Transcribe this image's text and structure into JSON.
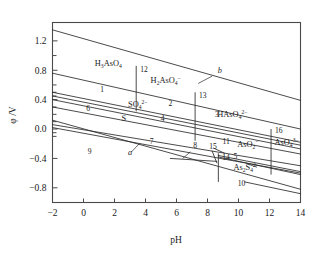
{
  "chart_data": {
    "type": "line",
    "title": "",
    "xlabel": "pH",
    "ylabel": "φ /V",
    "xlim": [
      -2,
      14
    ],
    "ylim": [
      -1.0,
      1.45
    ],
    "xticks": [
      -2,
      0,
      2,
      4,
      6,
      8,
      10,
      12,
      14
    ],
    "xticklabels": [
      "−2",
      "0",
      "2",
      "4",
      "6",
      "8",
      "10",
      "12",
      "14"
    ],
    "yticks": [
      1.2,
      0.8,
      0.4,
      0.0,
      -0.4,
      -0.8
    ],
    "yticklabels": [
      "1.2",
      "0.8",
      "0.4",
      "0.0",
      "−0.4",
      "−0.8"
    ],
    "grid": false,
    "legend": false,
    "minor_y_ticks": [
      1.0,
      0.6,
      0.5,
      0.45,
      0.3,
      0.2,
      0.1,
      -0.05,
      -0.1
    ],
    "series": [
      {
        "name": "b",
        "label": "b",
        "note": "O2/H2O upper water stability line",
        "points": [
          [
            -2,
            1.35
          ],
          [
            14,
            0.39
          ]
        ]
      },
      {
        "name": "1",
        "label": "1",
        "points": [
          [
            -2,
            0.76
          ],
          [
            14,
            0.0
          ]
        ]
      },
      {
        "name": "6",
        "label": "6",
        "points": [
          [
            -2,
            0.5
          ],
          [
            14,
            -0.18
          ]
        ]
      },
      {
        "name": "2",
        "label": "2",
        "points": [
          [
            -2,
            0.45
          ],
          [
            14,
            -0.22
          ]
        ]
      },
      {
        "name": "S",
        "label": "S",
        "note": "elemental sulfur field",
        "points": [
          [
            -2,
            0.4
          ],
          [
            14,
            -0.27
          ]
        ]
      },
      {
        "name": "4",
        "label": "4",
        "points": [
          [
            -2,
            0.3
          ],
          [
            14,
            -0.34
          ]
        ]
      },
      {
        "name": "a",
        "label": "a",
        "note": "H+/H2 lower water stability line",
        "points": [
          [
            -2,
            0.12
          ],
          [
            14,
            -0.82
          ]
        ]
      },
      {
        "name": "7",
        "label": "7",
        "points": [
          [
            -2,
            0.06
          ],
          [
            14,
            -0.5
          ]
        ]
      },
      {
        "name": "9",
        "label": "9",
        "points": [
          [
            -2,
            0.02
          ],
          [
            14,
            -0.6
          ]
        ]
      },
      {
        "name": "10",
        "label": "10",
        "points": [
          [
            10.4,
            -0.72
          ],
          [
            14,
            -0.88
          ]
        ]
      },
      {
        "name": "5",
        "label": "5",
        "points": [
          [
            8.7,
            -0.38
          ],
          [
            14,
            -0.62
          ]
        ]
      },
      {
        "name": "11",
        "label": "11",
        "points": [
          [
            8.7,
            -0.36
          ],
          [
            14,
            -0.58
          ]
        ]
      },
      {
        "name": "3",
        "label": "3",
        "points": [
          [
            8.4,
            -0.26
          ],
          [
            9.1,
            -0.33
          ]
        ]
      },
      {
        "name": "8",
        "label": "8",
        "points": [
          [
            5.6,
            -0.4
          ],
          [
            8.6,
            -0.44
          ]
        ]
      },
      {
        "name": "15",
        "label": "15",
        "points": [
          [
            8.3,
            -0.3
          ],
          [
            8.6,
            -0.46
          ]
        ]
      }
    ],
    "vertical_boundaries": [
      {
        "label": "12",
        "x": 3.4,
        "y0": 0.86,
        "y1": 0.24
      },
      {
        "label": "13",
        "x": 7.2,
        "y0": 0.5,
        "y1": -0.16
      },
      {
        "label": "14",
        "x": 8.7,
        "y0": -0.33,
        "y1": -0.72
      },
      {
        "label": "16",
        "x": 12.1,
        "y0": 0.0,
        "y1": -0.62
      }
    ],
    "species_labels": [
      {
        "text": "H3AsO4",
        "html": "H<sub>3</sub>AsO<sub>4</sub>",
        "x": 1.6,
        "y": 0.86
      },
      {
        "text": "H2AsO4-",
        "html": "H<sub>2</sub>AsO<sub>4</sub><sup>−</sup>",
        "x": 5.3,
        "y": 0.62
      },
      {
        "text": "HAsO4 2-",
        "html": "HAsO<sub>4</sub><sup>2−</sup>",
        "x": 9.6,
        "y": 0.16
      },
      {
        "text": "SO4 2-",
        "html": "SO<sub>4</sub><sup>2−</sup>",
        "x": 3.5,
        "y": 0.3
      },
      {
        "text": "AsO2-",
        "html": "AsO<sub>2</sub><sup>−</sup>",
        "x": 10.6,
        "y": -0.24
      },
      {
        "text": "AsO4 3-",
        "html": "AsO<sub>4</sub><sup>3−</sup>",
        "x": 13.1,
        "y": -0.22
      },
      {
        "text": "As2S4 2-",
        "html": "As<sub>2</sub>S<sub>4</sub><sup>2−</sup>",
        "x": 10.5,
        "y": -0.56
      },
      {
        "text": "S",
        "html": "S",
        "x": 2.6,
        "y": 0.11
      },
      {
        "text": "b",
        "html": "b",
        "x": 8.8,
        "y": 0.76
      },
      {
        "text": "a",
        "html": "a",
        "x": 3.0,
        "y": -0.36
      }
    ],
    "numeric_labels": [
      {
        "label": "1",
        "x": 1.2,
        "y": 0.51
      },
      {
        "label": "2",
        "x": 5.6,
        "y": 0.32
      },
      {
        "label": "3",
        "x": 8.6,
        "y": 0.16
      },
      {
        "label": "4",
        "x": 5.1,
        "y": 0.11
      },
      {
        "label": "5",
        "x": 9.8,
        "y": -0.41
      },
      {
        "label": "6",
        "x": 0.3,
        "y": 0.25
      },
      {
        "label": "7",
        "x": 4.4,
        "y": -0.2
      },
      {
        "label": "8",
        "x": 7.2,
        "y": -0.26
      },
      {
        "label": "9",
        "x": 0.4,
        "y": -0.34
      },
      {
        "label": "10",
        "x": 10.2,
        "y": -0.78
      },
      {
        "label": "11",
        "x": 9.2,
        "y": -0.21
      },
      {
        "label": "12",
        "x": 3.9,
        "y": 0.78
      },
      {
        "label": "13",
        "x": 7.7,
        "y": 0.42
      },
      {
        "label": "14",
        "x": 9.2,
        "y": -0.42
      },
      {
        "label": "15",
        "x": 8.35,
        "y": -0.27
      },
      {
        "label": "16",
        "x": 12.6,
        "y": -0.05
      }
    ],
    "leader_lines": [
      {
        "from": [
          8.3,
          0.72
        ],
        "to": [
          7.4,
          0.62
        ],
        "for": "b"
      },
      {
        "from": [
          3.1,
          -0.31
        ],
        "to": [
          3.6,
          -0.2
        ],
        "for": "a"
      },
      {
        "from": [
          6.9,
          -0.31
        ],
        "to": [
          6.4,
          -0.4
        ],
        "for": "8"
      },
      {
        "from": [
          10.5,
          -0.47
        ],
        "to": [
          11.2,
          -0.52
        ],
        "for": "arrow"
      }
    ]
  }
}
